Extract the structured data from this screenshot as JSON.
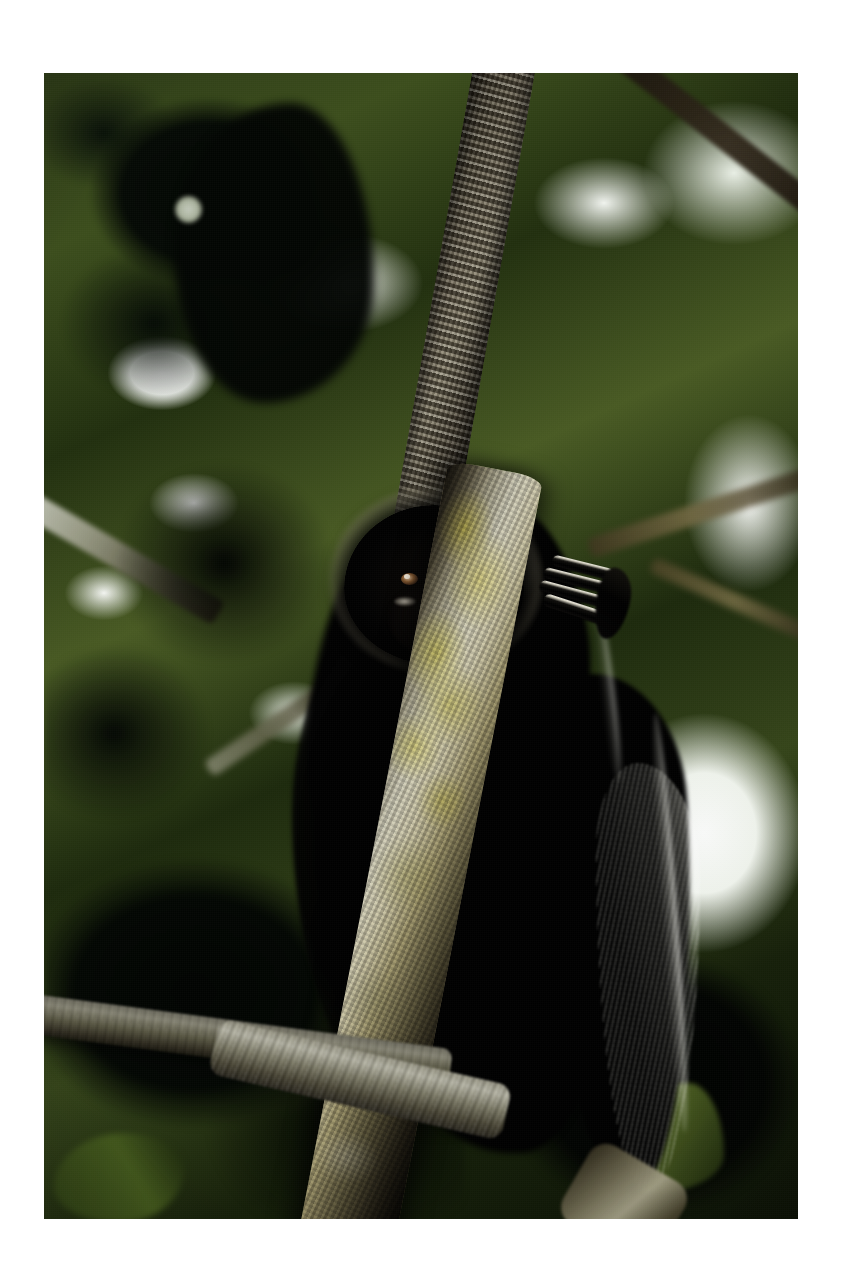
{
  "page": {
    "background_color": "#ffffff",
    "width": 850,
    "height": 1279,
    "caption": ""
  },
  "photo": {
    "frame": {
      "left": 44,
      "top": 73,
      "width": 754,
      "height": 1146,
      "border_color": "#ffffff"
    },
    "subject": {
      "common_name": "howler monkey",
      "description": "A black howler monkey clings to a lichen-covered tree branch in a rainforest canopy, looking down toward the camera.",
      "pose": "climbing, right hand gripping the branch above, tail hanging to the right"
    },
    "colors": {
      "page_background": "#ffffff",
      "sky_highlight": "#fdfdfd",
      "canopy_green_light": "#6e8433",
      "canopy_green_mid": "#3d4f1d",
      "canopy_green_dark": "#16200a",
      "leaf_silhouette": "#030603",
      "fur_black": "#000000",
      "fur_rim_light": "#e2e2d8",
      "bark_light": "#d6d3bd",
      "bark_mid": "#8d8b79",
      "bark_dark": "#1a150d",
      "lichen_yellow": "#c6ba48",
      "eye_amber": "#8c5f34",
      "eye_highlight": "#fff6e6"
    },
    "elements": {
      "upper_trunk_label": "vertical mottled bark trunk",
      "lower_branch_label": "diagonal lichen-covered branch",
      "horizontal_branch_label": "lower-left horizontal branch",
      "background_branch_tr_label": "dark diagonal branch upper right",
      "bokeh_label": "circular light bokeh in dark foliage",
      "sky_patch_label": "bright sky gap behind tail",
      "hand_label": "gripping hand with four fingers",
      "tail_label": "hanging rim-lit tail",
      "head_label": "backlit head with fur halo",
      "eye_left_label": "left eye",
      "eye_right_label": "right eye"
    }
  }
}
